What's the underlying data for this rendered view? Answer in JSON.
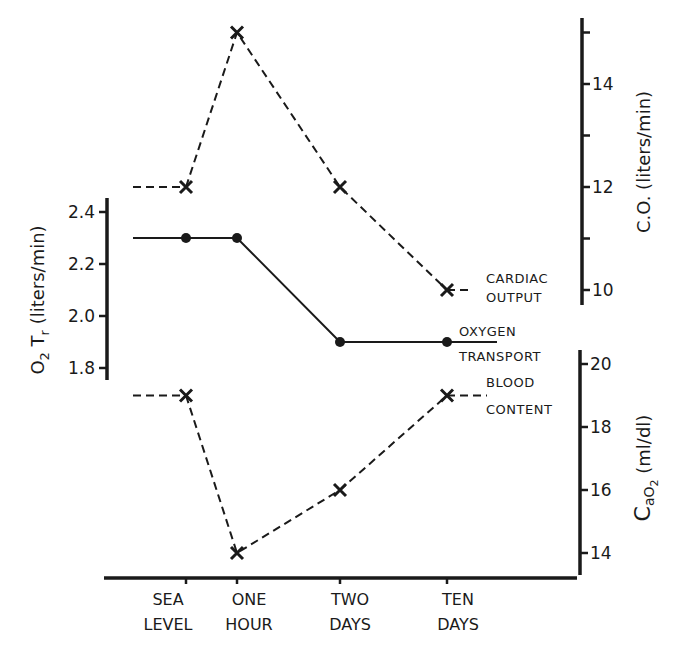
{
  "chart_data": {
    "type": "line",
    "title": "",
    "categories": [
      "SEA LEVEL",
      "ONE HOUR",
      "TWO DAYS",
      "TEN DAYS"
    ],
    "xlabel": "",
    "axes": {
      "left": {
        "label": "O2 Tr (liters/min)",
        "label_main": "O",
        "label_sub": "2",
        "label_rest": " T",
        "label_sub2": "r",
        "label_unit": "(liters/min)",
        "ticks": [
          2.4,
          2.2,
          2.0,
          1.8
        ],
        "tick_labels": [
          "2.4",
          "2.2",
          "2.0",
          "1.8"
        ],
        "range": [
          1.75,
          2.45
        ]
      },
      "right_upper": {
        "label": "C.O. (liters/min)",
        "ticks": [
          15,
          14,
          13,
          12,
          11,
          10
        ],
        "tick_labels": [
          "",
          "14",
          "",
          "12",
          "",
          "10"
        ],
        "range": [
          9.9,
          15.4
        ]
      },
      "right_lower": {
        "label": "CaO2 (ml/dl)",
        "label_main": "C",
        "label_sub": "aO",
        "label_sub2": "2",
        "label_unit": "(ml/dl)",
        "ticks": [
          20,
          18,
          16,
          14
        ],
        "tick_labels": [
          "20",
          "18",
          "16",
          "14"
        ],
        "range": [
          13.3,
          20.4
        ]
      }
    },
    "series": [
      {
        "name": "CARDIAC OUTPUT",
        "label_lines": [
          "CARDIAC",
          "OUTPUT"
        ],
        "axis": "right_upper",
        "style": "dashed",
        "marker": "x",
        "values": [
          12,
          15,
          12,
          10
        ]
      },
      {
        "name": "OXYGEN TRANSPORT",
        "label_lines": [
          "OXYGEN",
          "TRANSPORT"
        ],
        "axis": "left",
        "style": "solid",
        "marker": "dot",
        "values": [
          2.3,
          2.3,
          1.9,
          1.9
        ]
      },
      {
        "name": "BLOOD CONTENT",
        "label_lines": [
          "BLOOD",
          "CONTENT"
        ],
        "axis": "right_lower",
        "style": "dashed",
        "marker": "x",
        "values": [
          19,
          14,
          16,
          19
        ]
      }
    ],
    "grid": false,
    "legend_position": "inline-right"
  },
  "colors": {
    "ink": "#1a1a1a",
    "background": "#ffffff"
  }
}
